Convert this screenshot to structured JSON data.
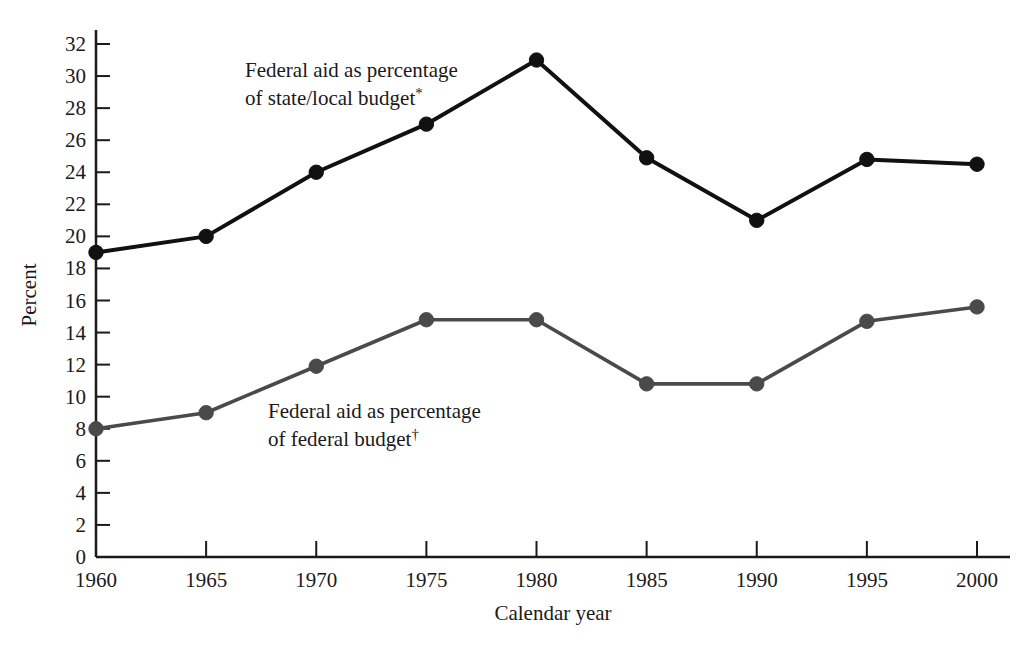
{
  "chart_data": {
    "type": "line",
    "title": "",
    "subtitle": "",
    "xlabel": "Calendar year",
    "ylabel": "Percent",
    "x": [
      1960,
      1965,
      1970,
      1975,
      1980,
      1985,
      1990,
      1995,
      2000
    ],
    "categories": [
      "1960",
      "1965",
      "1970",
      "1975",
      "1980",
      "1985",
      "1990",
      "1995",
      "2000"
    ],
    "xlim": [
      1960,
      2000
    ],
    "ylim": [
      0,
      32
    ],
    "ytick_step": 2,
    "yticks": [
      0,
      2,
      4,
      6,
      8,
      10,
      12,
      14,
      16,
      18,
      20,
      22,
      24,
      26,
      28,
      30,
      32
    ],
    "ytick_labels": [
      "0",
      "2",
      "4",
      "6",
      "8",
      "10",
      "12",
      "14",
      "16",
      "18",
      "20",
      "22",
      "24",
      "26",
      "28",
      "30",
      "32"
    ],
    "grid": false,
    "legend_position": "inline-annotation",
    "series": [
      {
        "name": "Federal aid as percentage of state/local budget*",
        "annotation_line1": "Federal aid as percentage",
        "annotation_line2": "of state/local budget",
        "annotation_marker": "*",
        "color": "#111111",
        "marker": "circle",
        "values": [
          19.0,
          20.0,
          24.0,
          27.0,
          31.0,
          24.9,
          21.0,
          24.8,
          24.5
        ]
      },
      {
        "name": "Federal aid as percentage of federal budget†",
        "annotation_line1": "Federal aid as percentage",
        "annotation_line2": "of federal budget",
        "annotation_marker": "†",
        "color": "#4a4a4a",
        "marker": "circle",
        "values": [
          8.0,
          9.0,
          11.9,
          14.8,
          14.8,
          10.8,
          10.8,
          14.7,
          15.6
        ]
      }
    ]
  },
  "axes": {
    "y_title": "Percent",
    "x_title": "Calendar year"
  },
  "colors": {
    "background": "#ffffff",
    "axis": "#1a1a1a",
    "series_upper": "#111111",
    "series_lower": "#4a4a4a",
    "text": "#1a1a1a"
  }
}
